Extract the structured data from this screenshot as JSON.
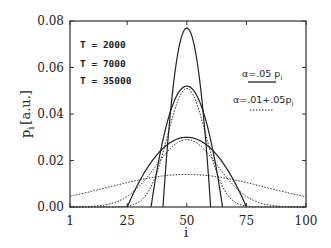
{
  "chart_data": {
    "type": "line",
    "title": "",
    "xlabel": "i",
    "ylabel": "p_i [a.u.]",
    "xlim": [
      1,
      100
    ],
    "ylim": [
      0.0,
      0.08
    ],
    "x_ticks": [
      "1",
      "25",
      "50",
      "75",
      "100"
    ],
    "y_ticks": [
      "0.00",
      "0.02",
      "0.04",
      "0.06",
      "0.08"
    ],
    "grid": false,
    "annotations": [
      "T = 2000",
      "T = 7000",
      "T = 35000"
    ],
    "legend": [
      {
        "label": "α=.05 p_i",
        "style": "solid"
      },
      {
        "label": "α=.01+.05p_i",
        "style": "dotted"
      }
    ],
    "legend_position": "upper right",
    "series": [
      {
        "name": "α=.05 p_i, T=2000",
        "style": "solid",
        "center": 50,
        "peak": 0.077,
        "support": [
          40,
          60
        ],
        "shape": "parabola"
      },
      {
        "name": "α=.05 p_i, T=7000",
        "style": "solid",
        "center": 50,
        "peak": 0.052,
        "support": [
          35,
          65
        ],
        "shape": "parabola"
      },
      {
        "name": "α=.05 p_i, T=35000",
        "style": "solid",
        "center": 50,
        "peak": 0.03,
        "support": [
          25,
          75
        ],
        "shape": "parabola"
      },
      {
        "name": "α=.01+.05p_i, T=2000",
        "style": "dotted",
        "center": 50,
        "peak": 0.051,
        "sigma": 8,
        "shape": "gaussian"
      },
      {
        "name": "α=.01+.05p_i, T=7000",
        "style": "dotted",
        "center": 50,
        "peak": 0.029,
        "sigma": 13,
        "shape": "gaussian"
      },
      {
        "name": "α=.01+.05p_i, T=35000",
        "style": "dotted",
        "center": 50,
        "peak": 0.014,
        "sigma": 33,
        "shape": "gaussian"
      }
    ]
  },
  "axes": {
    "x_title": "i",
    "y_title_main": "p",
    "y_title_sub": "i",
    "y_title_unit": "[a.u.]"
  },
  "annotations": {
    "t1": "T = 2000",
    "t2": "T = 7000",
    "t3": "T = 35000"
  },
  "legend": {
    "solid_label": "α=.05  p",
    "solid_sub": "i",
    "dotted_label": "α=.01+.05p",
    "dotted_sub": "i"
  },
  "colors": {
    "line": "#222222",
    "axis": "#333333",
    "background": "#ffffff"
  }
}
